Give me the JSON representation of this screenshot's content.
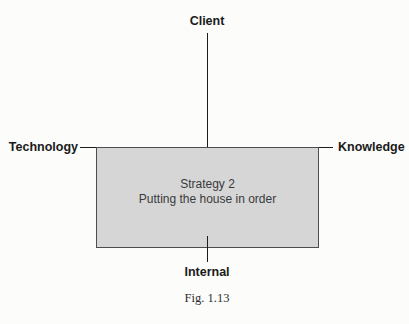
{
  "diagram": {
    "axis_labels": {
      "top": "Client",
      "left": "Technology",
      "right": "Knowledge",
      "bottom": "Internal"
    },
    "box": {
      "line1": "Strategy 2",
      "line2": "Putting the house in order"
    },
    "caption": "Fig. 1.13",
    "colors": {
      "background": "#fcfcfb",
      "line": "#1c1c1c",
      "box_fill": "#d6d6d6",
      "box_border": "#4d4d4d",
      "label_text": "#1a1a1a",
      "box_text": "#3a3a3a"
    }
  }
}
